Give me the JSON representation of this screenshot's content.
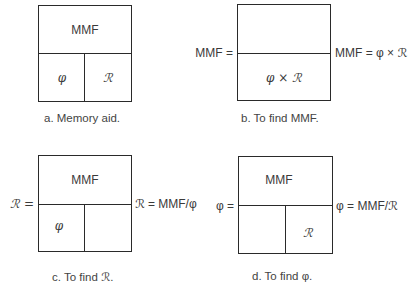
{
  "colors": {
    "line": "#2a2a2a",
    "text": "#3a3a3a",
    "background": "#ffffff"
  },
  "symbols": {
    "flux": "φ",
    "reluctance": "ℛ",
    "times": "×"
  },
  "panels": [
    {
      "id": "a",
      "top_label": "MMF",
      "bottom_left": "φ",
      "bottom_right": "ℛ",
      "left_eq": "",
      "right_eq": "",
      "caption": "a.  Memory aid."
    },
    {
      "id": "b",
      "top_label": "",
      "bottom_center": "φ × ℛ",
      "left_eq": "MMF =",
      "right_eq": "MMF = φ × ℛ",
      "caption": "b.  To find MMF."
    },
    {
      "id": "c",
      "top_label": "MMF",
      "bottom_left": "φ",
      "bottom_right": "",
      "left_eq": "ℛ =",
      "right_eq": "ℛ = MMF/φ",
      "caption": "c.  To find ℛ."
    },
    {
      "id": "d",
      "top_label": "MMF",
      "bottom_left": "",
      "bottom_right": "ℛ",
      "left_eq": "φ =",
      "right_eq": "φ = MMF/ℛ",
      "caption": "d.  To find φ."
    }
  ]
}
